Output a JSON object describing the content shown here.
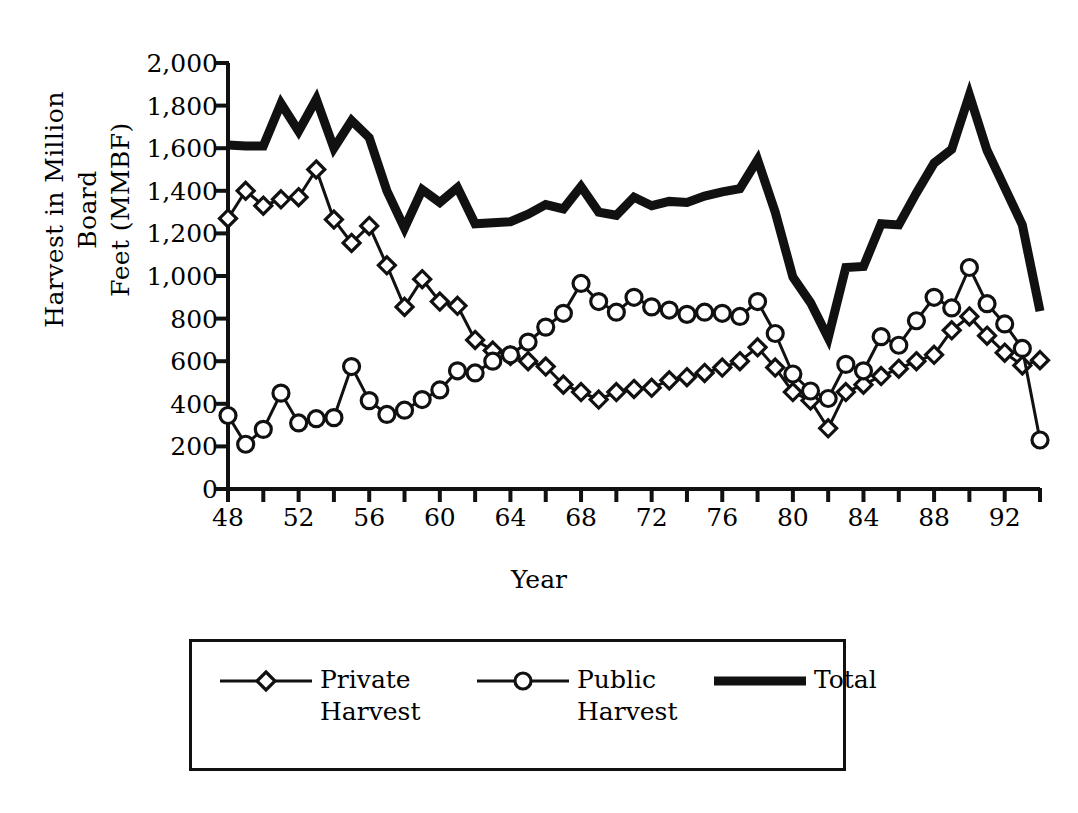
{
  "chart_data": {
    "type": "line",
    "title": "",
    "xlabel": "Year",
    "ylabel": "Harvest in Million Board\nFeet (MMBF)",
    "ylabel_line1": "Harvest in Million Board",
    "ylabel_line2": "Feet (MMBF)",
    "xlim": [
      48,
      94
    ],
    "ylim": [
      0,
      2000
    ],
    "ytick_interval": 200,
    "xtick_minor_interval": 2,
    "xtick_major_interval": 4,
    "grid": false,
    "legend_position": "below-axes",
    "yticks": [
      "2,000",
      "1,800",
      "1,600",
      "1,400",
      "1,200",
      "1,000",
      "800",
      "600",
      "400",
      "200",
      "0"
    ],
    "ytick_values": [
      2000,
      1800,
      1600,
      1400,
      1200,
      1000,
      800,
      600,
      400,
      200,
      0
    ],
    "xticks": [
      "48",
      "52",
      "56",
      "60",
      "64",
      "68",
      "72",
      "76",
      "80",
      "84",
      "88",
      "92"
    ],
    "xtick_values": [
      48,
      52,
      56,
      60,
      64,
      68,
      72,
      76,
      80,
      84,
      88,
      92
    ],
    "x": [
      48,
      49,
      50,
      51,
      52,
      53,
      54,
      55,
      56,
      57,
      58,
      59,
      60,
      61,
      62,
      63,
      64,
      65,
      66,
      67,
      68,
      69,
      70,
      71,
      72,
      73,
      74,
      75,
      76,
      77,
      78,
      79,
      80,
      81,
      82,
      83,
      84,
      85,
      86,
      87,
      88,
      89,
      90,
      91,
      92,
      93,
      94
    ],
    "series": [
      {
        "name": "Private Harvest",
        "legend_label": "Private\nHarvest",
        "marker": "diamond",
        "linewidth": 3,
        "color": "#111111",
        "values": [
          1270,
          1400,
          1330,
          1360,
          1370,
          1500,
          1265,
          1155,
          1235,
          1050,
          855,
          985,
          880,
          860,
          700,
          650,
          625,
          600,
          575,
          490,
          455,
          420,
          455,
          470,
          475,
          510,
          525,
          545,
          570,
          600,
          665,
          570,
          455,
          415,
          285,
          455,
          490,
          530,
          565,
          600,
          630,
          745,
          810,
          720,
          640,
          580,
          605
        ]
      },
      {
        "name": "Public Harvest",
        "legend_label": "Public\nHarvest",
        "marker": "circle",
        "linewidth": 3,
        "color": "#111111",
        "values": [
          345,
          210,
          280,
          450,
          310,
          330,
          335,
          575,
          415,
          350,
          370,
          420,
          465,
          555,
          545,
          600,
          630,
          690,
          760,
          825,
          965,
          880,
          830,
          900,
          855,
          840,
          820,
          830,
          825,
          810,
          880,
          730,
          540,
          460,
          425,
          585,
          555,
          715,
          675,
          790,
          900,
          850,
          1040,
          870,
          775,
          660,
          230
        ]
      },
      {
        "name": "Total",
        "legend_label": "Total",
        "marker": "none",
        "linewidth": 9,
        "color": "#111111",
        "values": [
          1615,
          1610,
          1610,
          1810,
          1680,
          1830,
          1600,
          1730,
          1650,
          1400,
          1225,
          1405,
          1345,
          1415,
          1245,
          1250,
          1255,
          1290,
          1335,
          1315,
          1420,
          1300,
          1285,
          1370,
          1330,
          1350,
          1345,
          1375,
          1395,
          1410,
          1545,
          1300,
          995,
          875,
          710,
          1040,
          1045,
          1245,
          1240,
          1390,
          1530,
          1595,
          1850,
          1590,
          1415,
          1240,
          835
        ]
      }
    ]
  },
  "legend": {
    "entries": [
      {
        "label": "Private\nHarvest",
        "marker": "diamond-marker-icon"
      },
      {
        "label": "Public\nHarvest",
        "marker": "circle-marker-icon"
      },
      {
        "label": "Total",
        "marker": "thick-line-icon"
      }
    ]
  }
}
